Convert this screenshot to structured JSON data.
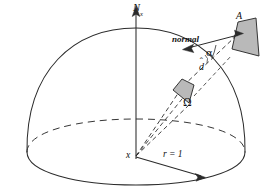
{
  "figure": {
    "background_color": "#ffffff",
    "stroke_color": "#2b2b2b",
    "patch_fill_color": "#b9b9b9",
    "patch_stroke_color": "#2b2b2b",
    "labels": {
      "axis": "N",
      "axis_subscript": "x",
      "patch_far": "A",
      "normal": "normal",
      "alpha": "α",
      "direction": "d",
      "direction_hat": "ˆ",
      "solid_angle": "Ω",
      "center_point": "x",
      "radius": "r = 1"
    },
    "elements": {
      "dome_arc": "solid hemisphere outline",
      "base_front_arc": "solid front half of base ellipse",
      "base_back_arc": "dashed back half of base ellipse",
      "equator_back_arc": "dashed interior ellipse arc",
      "vertical_axis": "vertical line with arrowhead at top",
      "radius_arrow": "arrow from center to rim",
      "cone_rays": "dashed rays from center through solid angle patch",
      "normal_arrow": "arrow from patch A pointing down-left",
      "angle_arc": "small arc marking angle alpha"
    }
  }
}
